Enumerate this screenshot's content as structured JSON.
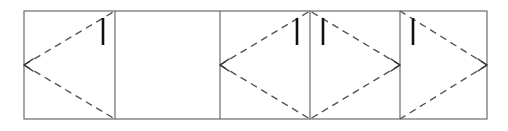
{
  "document": {
    "title": "Folded strip diagram",
    "background_color": "#ffffff",
    "width": 508,
    "height": 131
  },
  "strip": {
    "name": "horizontal-cell-strip",
    "outline_color": "#6b6b6b",
    "outline_width": 1.2,
    "top": 11,
    "bottom": 119,
    "left": 24,
    "right": 487,
    "divider_x": [
      115,
      220,
      310,
      400
    ],
    "cell_edges_x": [
      24,
      115,
      220,
      310,
      400,
      487
    ]
  },
  "cells": [
    {
      "id": "cell-1",
      "index": 1,
      "x0": 24,
      "x1": 115,
      "empty": false,
      "crease_direction": "left",
      "arrow_vertex": {
        "x": 24,
        "y": 65
      },
      "tick": {
        "x": 103,
        "y_top": 18,
        "y_bottom": 45
      }
    },
    {
      "id": "cell-2",
      "index": 2,
      "x0": 115,
      "x1": 220,
      "empty": true,
      "crease_direction": "none",
      "arrow_vertex": null,
      "tick": null
    },
    {
      "id": "cell-3",
      "index": 3,
      "x0": 220,
      "x1": 310,
      "empty": false,
      "crease_direction": "left",
      "arrow_vertex": {
        "x": 220,
        "y": 65
      },
      "tick": {
        "x": 297,
        "y_top": 18,
        "y_bottom": 45
      }
    },
    {
      "id": "cell-4",
      "index": 4,
      "x0": 310,
      "x1": 400,
      "empty": false,
      "crease_direction": "right",
      "arrow_vertex": {
        "x": 400,
        "y": 65
      },
      "tick": {
        "x": 323,
        "y_top": 18,
        "y_bottom": 45
      }
    },
    {
      "id": "cell-5",
      "index": 5,
      "x0": 400,
      "x1": 487,
      "empty": false,
      "crease_direction": "right",
      "arrow_vertex": {
        "x": 487,
        "y": 65
      },
      "tick": {
        "x": 413,
        "y_top": 18,
        "y_bottom": 45
      }
    }
  ],
  "style": {
    "dash_color": "#555555",
    "dash_width": 1.4,
    "dash_pattern": "7 5",
    "tick_color": "#111111",
    "tick_width": 2.6,
    "arrow_color": "#333333",
    "arrow_width": 1.4,
    "arrow_size": 9
  }
}
